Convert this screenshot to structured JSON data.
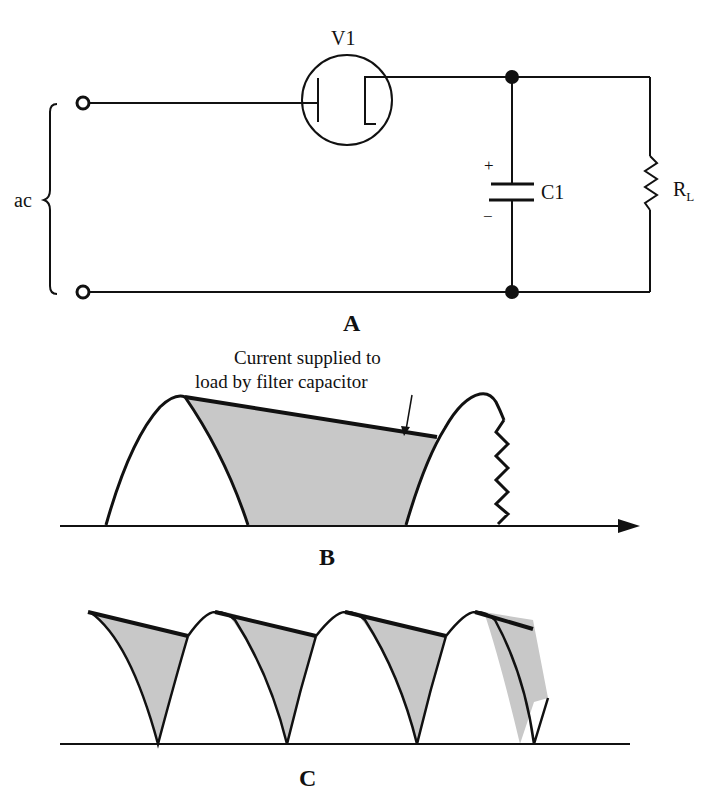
{
  "colors": {
    "line": "#111111",
    "fill": "#c8c8c8",
    "background": "#ffffff"
  },
  "circuit": {
    "tube_label": "V1",
    "source_label": "ac",
    "capacitor_label": "C1",
    "cap_plus": "+",
    "cap_minus": "−",
    "load_label": "R",
    "load_subscript": "L",
    "panel_label": "A"
  },
  "half_wave": {
    "annotation_line1": "Current supplied to",
    "annotation_line2": "load by filter capacitor",
    "panel_label": "B"
  },
  "full_wave": {
    "panel_label": "C"
  }
}
